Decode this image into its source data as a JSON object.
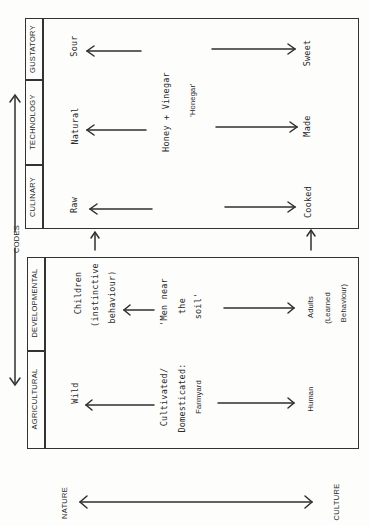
{
  "codes_label": "CODES",
  "axis": {
    "left": "NATURE",
    "right": "CULTURE"
  },
  "top_box": {
    "headers": [
      "GUSTATORY",
      "TECHNOLOGY",
      "CULINARY"
    ],
    "rows": [
      {
        "nature": "Sour",
        "culture": "Sweet"
      },
      {
        "nature": "Natural",
        "culture": "Made"
      },
      {
        "nature": "Raw",
        "culture": "Cooked"
      }
    ],
    "mediator_lines": [
      "Honey + Vinegar",
      "'Honegar'"
    ]
  },
  "bottom_box": {
    "headers": [
      "DEVELOPMENTAL",
      "AGRICULTURAL"
    ],
    "rows": [
      {
        "nature_lines": [
          "Children",
          "(instinctive",
          "behaviour)"
        ],
        "mediator_lines": [
          "'Men near",
          "the",
          "soil'"
        ],
        "culture_lines": [
          "Adults",
          "(Learned",
          "Behaviour)"
        ]
      },
      {
        "nature_lines": [
          "Wild"
        ],
        "mediator_lines": [
          "Cultivated/",
          "Domesticated:",
          "Farmyard"
        ],
        "culture_lines": [
          "Human"
        ]
      }
    ]
  }
}
